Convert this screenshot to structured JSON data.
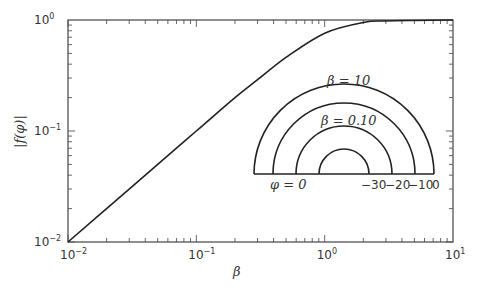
{
  "chart_data": {
    "type": "line",
    "title": "",
    "xlabel": "β",
    "ylabel": "|f(φ)|",
    "xscale": "log",
    "yscale": "log",
    "xlim": [
      0.01,
      10
    ],
    "ylim": [
      0.01,
      1
    ],
    "x_ticks": [
      {
        "base": "10",
        "exp": "−2"
      },
      {
        "base": "10",
        "exp": "−1"
      },
      {
        "base": "10",
        "exp": "0"
      },
      {
        "base": "10",
        "exp": "1"
      }
    ],
    "y_ticks": [
      {
        "base": "10",
        "exp": "−2"
      },
      {
        "base": "10",
        "exp": "−1"
      },
      {
        "base": "10",
        "exp": "0"
      }
    ],
    "grid": false,
    "legend": null,
    "series": [
      {
        "name": "|f(φ)| vs β",
        "x": [
          0.01,
          0.02,
          0.05,
          0.1,
          0.2,
          0.3,
          0.5,
          1.0,
          2.0,
          3.0,
          5.0,
          10.0
        ],
        "y": [
          0.01,
          0.02,
          0.05,
          0.1,
          0.2,
          0.29,
          0.46,
          0.76,
          0.95,
          0.98,
          0.99,
          1.0
        ]
      }
    ],
    "inset": {
      "type": "semicircle-diagram",
      "labels": [
        "β = 10",
        "β = 0.10",
        "φ = 0",
        "−30",
        "−20",
        "−10",
        "0"
      ],
      "radii_px": [
        90,
        71,
        48,
        25
      ]
    }
  },
  "labels": {
    "inset_beta_outer": "β = 10",
    "inset_beta_mid": "β = 0.10",
    "inset_phi": "φ = 0",
    "inset_m30": "−30",
    "inset_m20": "−20",
    "inset_m10": "−10",
    "inset_zero": "0"
  }
}
